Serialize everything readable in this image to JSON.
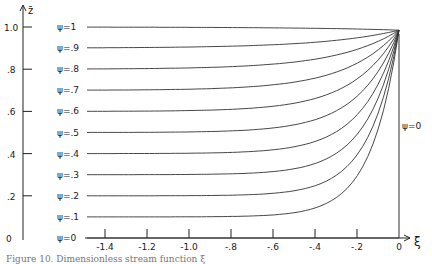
{
  "chart_data": {
    "type": "line",
    "title": "",
    "xlabel": "ξ",
    "ylabel": "z̄",
    "xlim": [
      -1.5,
      0
    ],
    "ylim": [
      0,
      1.0
    ],
    "x_ticks": [
      "-1.4",
      "-1.2",
      "-1.0",
      "-.8",
      "-.6",
      "-.4",
      "-.2",
      "0"
    ],
    "y_ticks": [
      "0",
      ".2",
      ".4",
      ".6",
      ".8",
      "1.0"
    ],
    "grid": false,
    "legend_position": "inline-left",
    "annotations": [
      "ψ=0"
    ],
    "series": [
      {
        "name": "ψ=1",
        "psi": 1.0,
        "x": [
          -1.5,
          -1.0,
          -0.5,
          -0.2,
          0
        ],
        "values": [
          1.0,
          1.0,
          0.995,
          0.99,
          0.985
        ]
      },
      {
        "name": "ψ=.9",
        "psi": 0.9,
        "x": [
          -1.5,
          -1.0,
          -0.5,
          -0.2,
          0
        ],
        "values": [
          0.9,
          0.905,
          0.925,
          0.95,
          0.985
        ]
      },
      {
        "name": "ψ=.8",
        "psi": 0.8,
        "x": [
          -1.5,
          -1.0,
          -0.5,
          -0.2,
          0
        ],
        "values": [
          0.8,
          0.81,
          0.855,
          0.91,
          0.985
        ]
      },
      {
        "name": "ψ=.7",
        "psi": 0.7,
        "x": [
          -1.5,
          -1.0,
          -0.5,
          -0.2,
          0
        ],
        "values": [
          0.7,
          0.715,
          0.78,
          0.87,
          0.985
        ]
      },
      {
        "name": "ψ=.6",
        "psi": 0.6,
        "x": [
          -1.5,
          -1.0,
          -0.5,
          -0.2,
          0
        ],
        "values": [
          0.6,
          0.615,
          0.7,
          0.82,
          0.985
        ]
      },
      {
        "name": "ψ=.5",
        "psi": 0.5,
        "x": [
          -1.5,
          -1.0,
          -0.5,
          -0.2,
          0
        ],
        "values": [
          0.5,
          0.515,
          0.61,
          0.77,
          0.985
        ]
      },
      {
        "name": "ψ=.4",
        "psi": 0.4,
        "x": [
          -1.5,
          -1.0,
          -0.5,
          -0.2,
          0
        ],
        "values": [
          0.4,
          0.41,
          0.51,
          0.7,
          0.985
        ]
      },
      {
        "name": "ψ=.3",
        "psi": 0.3,
        "x": [
          -1.5,
          -1.0,
          -0.5,
          -0.2,
          0
        ],
        "values": [
          0.3,
          0.31,
          0.39,
          0.6,
          0.985
        ]
      },
      {
        "name": "ψ=.2",
        "psi": 0.2,
        "x": [
          -1.5,
          -1.0,
          -0.5,
          -0.2,
          0
        ],
        "values": [
          0.2,
          0.205,
          0.26,
          0.47,
          0.985
        ]
      },
      {
        "name": "ψ=.1",
        "psi": 0.1,
        "x": [
          -1.5,
          -1.0,
          -0.5,
          -0.2,
          0
        ],
        "values": [
          0.1,
          0.102,
          0.13,
          0.3,
          0.985
        ]
      },
      {
        "name": "ψ=0",
        "psi": 0.0,
        "x": [
          -1.5,
          0
        ],
        "values": [
          0.0,
          0.0
        ]
      }
    ]
  },
  "labels": {
    "y_axis": "z̄",
    "x_axis": "ξ",
    "psi_zero_right": "ψ=0",
    "psi_labels": [
      "ψ=1",
      "ψ=.9",
      "ψ=.8",
      "ψ=.7",
      "ψ=.6",
      "ψ=.5",
      "ψ=.4",
      "ψ=.3",
      "ψ=.2",
      "ψ=.1",
      "ψ=0"
    ]
  },
  "caption": "Figure 10.  Dimensionless stream function ξ"
}
